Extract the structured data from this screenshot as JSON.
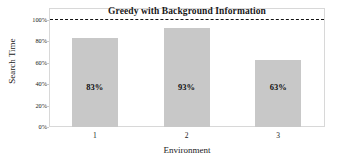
{
  "chart_data": {
    "type": "bar",
    "title": "Greedy with Background Information",
    "xlabel": "Environment",
    "ylabel": "Search Time",
    "categories": [
      "1",
      "2",
      "3"
    ],
    "values": [
      83,
      93,
      63
    ],
    "value_labels": [
      "83%",
      "93%",
      "63%"
    ],
    "ylim": [
      0,
      100
    ],
    "yticks": [
      0,
      20,
      40,
      60,
      80,
      100
    ],
    "ytick_labels": [
      "0%",
      "20%",
      "40%",
      "60%",
      "80%",
      "100%"
    ],
    "grid": false,
    "legend": "none",
    "bar_color": "#c8c8c8",
    "reference_line": {
      "value": 100,
      "label": "100%",
      "style": "dashed",
      "color": "#111111"
    }
  }
}
